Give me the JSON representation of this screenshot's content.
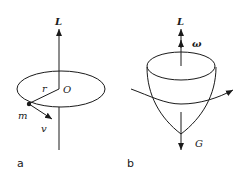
{
  "panels": [
    {
      "id": "a",
      "label": "a",
      "labels": {
        "angular_momentum": "L",
        "center": "O",
        "radius": "r",
        "mass": "m",
        "velocity": "v"
      }
    },
    {
      "id": "b",
      "label": "b",
      "labels": {
        "angular_momentum": "L",
        "angular_velocity": "ω",
        "gravity": "G"
      }
    }
  ],
  "colors": {
    "stroke": "#1a1a1a",
    "background": "#ffffff"
  }
}
